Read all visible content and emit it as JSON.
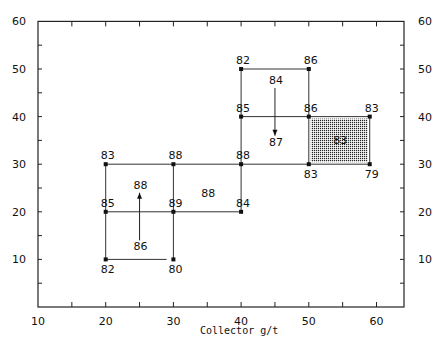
{
  "chart_data": {
    "type": "scatter",
    "title": "",
    "xlabel": "Collector  g/t",
    "ylabel": "",
    "xlim": [
      10,
      65
    ],
    "ylim": [
      0,
      60
    ],
    "xticks": [
      10,
      20,
      30,
      40,
      50,
      60
    ],
    "yticks": [
      10,
      20,
      30,
      40,
      50,
      60
    ],
    "grid": false,
    "points": [
      {
        "x": 20,
        "y": 10,
        "value": 82
      },
      {
        "x": 30,
        "y": 10,
        "value": 80
      },
      {
        "x": 20,
        "y": 20,
        "value": 85
      },
      {
        "x": 30,
        "y": 20,
        "value": 89
      },
      {
        "x": 40,
        "y": 20,
        "value": 84
      },
      {
        "x": 20,
        "y": 30,
        "value": 83
      },
      {
        "x": 30,
        "y": 30,
        "value": 88
      },
      {
        "x": 40,
        "y": 30,
        "value": 88
      },
      {
        "x": 50,
        "y": 30,
        "value": 83
      },
      {
        "x": 59,
        "y": 30,
        "value": 79
      },
      {
        "x": 40,
        "y": 40,
        "value": 85
      },
      {
        "x": 50,
        "y": 40,
        "value": 86
      },
      {
        "x": 59,
        "y": 40,
        "value": 83
      },
      {
        "x": 40,
        "y": 50,
        "value": 82
      },
      {
        "x": 50,
        "y": 50,
        "value": 86
      }
    ],
    "cell_labels": [
      {
        "x": 25,
        "y": 14,
        "value": 86
      },
      {
        "x": 25,
        "y": 24,
        "value": 88
      },
      {
        "x": 35,
        "y": 24,
        "value": 88
      },
      {
        "x": 45,
        "y": 46,
        "value": 84
      },
      {
        "x": 45,
        "y": 36,
        "value": 87
      },
      {
        "x": 54.5,
        "y": 35,
        "value": 83
      }
    ],
    "arrows": [
      {
        "from": [
          25,
          14
        ],
        "to": [
          25,
          24
        ]
      },
      {
        "from": [
          45,
          46
        ],
        "to": [
          45,
          36
        ]
      }
    ],
    "highlighted_region": {
      "x": [
        50,
        59
      ],
      "y": [
        30,
        40
      ],
      "value": 83
    }
  }
}
